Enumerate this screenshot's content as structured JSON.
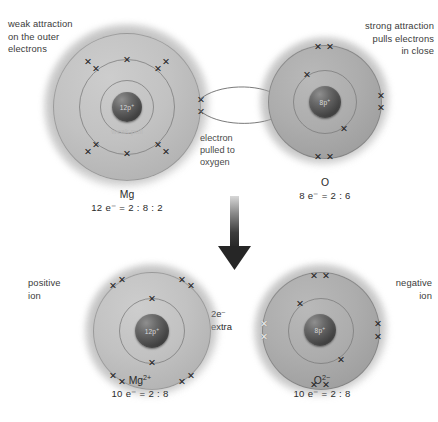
{
  "diagram": {
    "annotations": {
      "top_left": "weak attraction\non the outer\nelectrons",
      "top_right": "strong attraction\npulls electrons\nin close",
      "transfer": "electron\npulled to\noxygen",
      "extra_electrons": "2e⁻\nextra",
      "positive_ion": "positive\nion",
      "negative_ion": "negative\nion",
      "weak_pull": "weak pull"
    },
    "atoms": {
      "magnesium": {
        "name": "Mg",
        "symbol": "Mg",
        "nucleus_label": "12p",
        "nucleus_charge": "+",
        "configuration": "12 e⁻ = 2 : 8 : 2",
        "electron_count": 12,
        "shells": [
          2,
          8,
          2
        ]
      },
      "oxygen": {
        "name": "O",
        "symbol": "O",
        "nucleus_label": "8p",
        "nucleus_charge": "+",
        "configuration": "8 e⁻ = 2 : 6",
        "electron_count": 8,
        "shells": [
          2,
          6
        ]
      },
      "magnesium_ion": {
        "name": "Mg2+",
        "symbol": "Mg",
        "charge": "2+",
        "nucleus_label": "12p",
        "nucleus_charge": "+",
        "configuration": "10 e⁻ = 2 : 8",
        "electron_count": 10,
        "shells": [
          2,
          8
        ]
      },
      "oxide_ion": {
        "name": "O2-",
        "symbol": "O",
        "charge": "2−",
        "nucleus_label": "8p",
        "nucleus_charge": "+",
        "configuration": "10 e⁻ = 2 : 8",
        "electron_count": 10,
        "shells": [
          2,
          8
        ],
        "extra_electrons": 2
      }
    },
    "colors": {
      "shell_fill_light": "#c2c2c2",
      "shell_fill_dense": "#adadad",
      "nucleus": "#3a3a3a",
      "electron": "#232323",
      "extra_electron": "#f2f2f2",
      "text": "#2b2b2b",
      "annotation_text": "#3b3b3b",
      "arrow": "#2e2e2e",
      "transfer_text": "#4a4a4a",
      "weak_pull_text": "#b9b9b9"
    },
    "electron_marker": "cross-x"
  }
}
